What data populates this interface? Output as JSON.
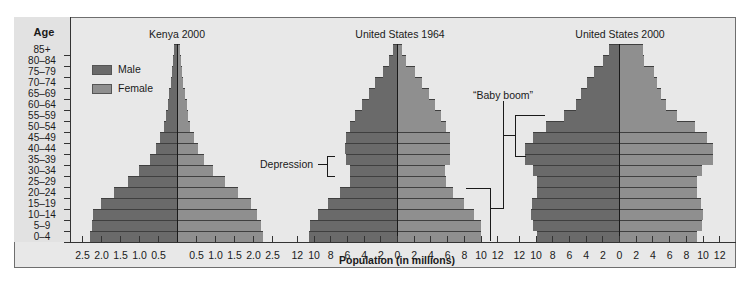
{
  "chart_data": {
    "type": "bar",
    "subtype": "population-pyramid",
    "title": "",
    "xlabel": "Population (in millions)",
    "ylabel": "Age",
    "categories": [
      "0-4",
      "5-9",
      "10-14",
      "15-19",
      "20-24",
      "25-29",
      "30-34",
      "35-39",
      "40-44",
      "45-49",
      "50-54",
      "55-59",
      "60-64",
      "65-69",
      "70-74",
      "75-79",
      "80-84",
      "85+"
    ],
    "legend": [
      {
        "name": "Male",
        "color": "#6a6a6a"
      },
      {
        "name": "Female",
        "color": "#8f8f8f"
      }
    ],
    "panels": [
      {
        "title": "Kenya 2000",
        "xlim": [
          -2.5,
          2.5
        ],
        "ticks_left": [
          "2.5",
          "2.0",
          "1.5",
          "1.0",
          "0.5"
        ],
        "ticks_right": [
          "0.5",
          "1.0",
          "1.5",
          "2.0",
          "2.5"
        ],
        "series": [
          {
            "name": "Male",
            "values": [
              2.3,
              2.25,
              2.2,
              2.0,
              1.65,
              1.3,
              1.0,
              0.7,
              0.55,
              0.45,
              0.35,
              0.3,
              0.25,
              0.2,
              0.15,
              0.12,
              0.1,
              0.08
            ]
          },
          {
            "name": "Female",
            "values": [
              2.25,
              2.2,
              2.1,
              1.95,
              1.6,
              1.25,
              0.95,
              0.7,
              0.55,
              0.45,
              0.35,
              0.3,
              0.25,
              0.2,
              0.15,
              0.12,
              0.1,
              0.08
            ]
          }
        ]
      },
      {
        "title": "United States 1964",
        "xlim": [
          -12,
          12
        ],
        "ticks_left": [
          "12",
          "10",
          "8",
          "6",
          "4",
          "2"
        ],
        "ticks_right": [
          "0",
          "2",
          "4",
          "6",
          "8",
          "10",
          "12"
        ],
        "series": [
          {
            "name": "Male",
            "values": [
              10.5,
              10.4,
              9.5,
              8.3,
              6.8,
              5.6,
              5.6,
              6.1,
              6.2,
              6.1,
              5.6,
              5.0,
              4.2,
              3.3,
              2.6,
              1.7,
              0.9,
              0.5
            ]
          },
          {
            "name": "Female",
            "values": [
              10.0,
              10.0,
              9.2,
              8.0,
              6.7,
              5.9,
              5.7,
              6.3,
              6.4,
              6.3,
              5.9,
              5.3,
              4.6,
              3.8,
              3.0,
              2.1,
              1.1,
              0.6
            ]
          }
        ]
      },
      {
        "title": "United States 2000",
        "xlim": [
          -12,
          12
        ],
        "ticks_left": [
          "12",
          "10",
          "8",
          "6",
          "4",
          "2"
        ],
        "ticks_right": [
          "0",
          "2",
          "4",
          "6",
          "8",
          "10",
          "12"
        ],
        "series": [
          {
            "name": "Male",
            "values": [
              9.8,
              10.3,
              10.5,
              10.4,
              9.8,
              9.8,
              10.3,
              11.2,
              11.3,
              10.3,
              8.8,
              6.6,
              5.2,
              4.5,
              3.8,
              3.0,
              1.9,
              1.2
            ]
          },
          {
            "name": "Female",
            "values": [
              9.4,
              9.9,
              10.0,
              9.8,
              9.4,
              9.3,
              9.9,
              11.2,
              11.3,
              10.5,
              9.1,
              6.9,
              5.6,
              5.0,
              4.6,
              4.2,
              3.0,
              2.9
            ]
          }
        ]
      }
    ],
    "annotations": [
      {
        "text": "Depression",
        "panel": "United States 1964",
        "ages": [
          "25-29",
          "30-34"
        ]
      },
      {
        "text": "“Baby boom”",
        "panels": [
          "United States 1964",
          "United States 2000"
        ],
        "ages_1964": [
          "0-4",
          "15-19"
        ],
        "ages_2000": [
          "35-39",
          "50-54"
        ]
      }
    ]
  },
  "labels": {
    "age_title": "Age",
    "legend_male": "Male",
    "legend_female": "Female",
    "xlabel": "Population (in millions)",
    "depression": "Depression",
    "baby_boom": "“Baby boom”",
    "panel_titles": [
      "Kenya 2000",
      "United States 1964",
      "United States 2000"
    ]
  }
}
